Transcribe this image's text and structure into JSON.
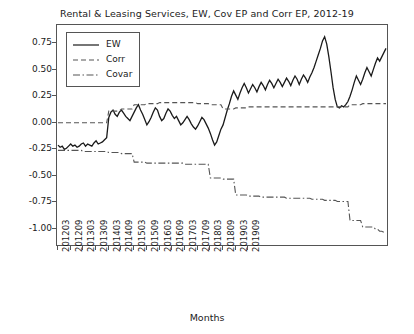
{
  "chart_data": {
    "type": "line",
    "title": "Rental & Leasing Services, EW, Cov EP and Corr EP, 2012-19",
    "xlabel": "Months",
    "ylabel": "",
    "ylim": [
      -1.15,
      0.92
    ],
    "yticks": [
      0.75,
      0.5,
      0.25,
      0.0,
      -0.25,
      -0.5,
      -0.75,
      -1.0
    ],
    "ytick_labels": [
      "0.75",
      "0.50",
      "0.25",
      "0.00",
      "-0.25",
      "-0.50",
      "-0.75",
      "-1.00"
    ],
    "xtick_labels": [
      "201203",
      "201209",
      "201303",
      "201309",
      "201403",
      "201409",
      "201503",
      "201509",
      "201603",
      "201609",
      "201703",
      "201709",
      "201803",
      "201809",
      "201903",
      "201909"
    ],
    "grid": false,
    "legend_position": "upper left",
    "series": [
      {
        "name": "EW",
        "style": "solid",
        "color": "#1a1a1a",
        "values": [
          -0.21,
          -0.23,
          -0.22,
          -0.25,
          -0.24,
          -0.22,
          -0.2,
          -0.22,
          -0.21,
          -0.23,
          -0.22,
          -0.2,
          -0.19,
          -0.22,
          -0.2,
          -0.21,
          -0.22,
          -0.19,
          -0.17,
          -0.2,
          -0.19,
          -0.18,
          -0.16,
          -0.14,
          0.05,
          0.1,
          0.12,
          0.08,
          0.06,
          0.1,
          0.12,
          0.09,
          0.06,
          0.04,
          0.02,
          0.06,
          0.1,
          0.14,
          0.17,
          0.12,
          0.08,
          0.03,
          -0.02,
          0.01,
          0.05,
          0.1,
          0.14,
          0.12,
          0.06,
          0.02,
          0.04,
          0.09,
          0.13,
          0.11,
          0.07,
          0.04,
          0.06,
          0.02,
          -0.02,
          0.0,
          0.03,
          0.06,
          0.03,
          -0.01,
          -0.04,
          -0.06,
          -0.03,
          0.01,
          0.05,
          0.03,
          -0.01,
          -0.05,
          -0.1,
          -0.16,
          -0.21,
          -0.18,
          -0.12,
          -0.06,
          -0.02,
          0.05,
          0.12,
          0.18,
          0.25,
          0.3,
          0.26,
          0.22,
          0.28,
          0.33,
          0.37,
          0.33,
          0.28,
          0.32,
          0.36,
          0.33,
          0.29,
          0.34,
          0.38,
          0.35,
          0.31,
          0.36,
          0.4,
          0.37,
          0.33,
          0.37,
          0.41,
          0.38,
          0.34,
          0.38,
          0.42,
          0.39,
          0.35,
          0.4,
          0.44,
          0.41,
          0.36,
          0.41,
          0.45,
          0.42,
          0.38,
          0.43,
          0.47,
          0.52,
          0.58,
          0.64,
          0.7,
          0.77,
          0.81,
          0.74,
          0.62,
          0.48,
          0.33,
          0.22,
          0.15,
          0.14,
          0.16,
          0.15,
          0.17,
          0.2,
          0.25,
          0.31,
          0.38,
          0.44,
          0.4,
          0.36,
          0.41,
          0.47,
          0.52,
          0.48,
          0.44,
          0.5,
          0.56,
          0.61,
          0.58,
          0.62,
          0.66,
          0.7
        ]
      },
      {
        "name": "Corr",
        "style": "dashed",
        "color": "#555555",
        "values": [
          0.0,
          0.0,
          0.0,
          0.0,
          0.0,
          0.0,
          0.0,
          0.0,
          0.0,
          0.0,
          0.0,
          0.0,
          0.0,
          0.0,
          0.0,
          0.0,
          0.0,
          0.0,
          0.0,
          0.0,
          0.0,
          0.0,
          0.0,
          0.0,
          0.11,
          0.11,
          0.11,
          0.11,
          0.11,
          0.11,
          0.13,
          0.13,
          0.13,
          0.13,
          0.13,
          0.13,
          0.17,
          0.17,
          0.17,
          0.17,
          0.17,
          0.17,
          0.18,
          0.18,
          0.18,
          0.18,
          0.18,
          0.18,
          0.19,
          0.19,
          0.19,
          0.19,
          0.19,
          0.19,
          0.19,
          0.19,
          0.19,
          0.19,
          0.19,
          0.19,
          0.19,
          0.19,
          0.19,
          0.19,
          0.19,
          0.19,
          0.18,
          0.18,
          0.18,
          0.18,
          0.18,
          0.18,
          0.17,
          0.17,
          0.17,
          0.17,
          0.17,
          0.17,
          0.13,
          0.13,
          0.13,
          0.13,
          0.13,
          0.13,
          0.14,
          0.14,
          0.14,
          0.14,
          0.14,
          0.14,
          0.15,
          0.15,
          0.15,
          0.15,
          0.15,
          0.15,
          0.15,
          0.15,
          0.15,
          0.15,
          0.15,
          0.15,
          0.15,
          0.15,
          0.15,
          0.15,
          0.15,
          0.15,
          0.15,
          0.15,
          0.15,
          0.15,
          0.15,
          0.15,
          0.15,
          0.15,
          0.15,
          0.15,
          0.15,
          0.15,
          0.15,
          0.15,
          0.15,
          0.15,
          0.15,
          0.15,
          0.15,
          0.15,
          0.15,
          0.15,
          0.15,
          0.15,
          0.15,
          0.15,
          0.15,
          0.15,
          0.15,
          0.15,
          0.17,
          0.17,
          0.17,
          0.17,
          0.17,
          0.17,
          0.18,
          0.18,
          0.18,
          0.18,
          0.18,
          0.18,
          0.18,
          0.18,
          0.18,
          0.18,
          0.18,
          0.18
        ]
      },
      {
        "name": "Covar",
        "style": "dashdot",
        "color": "#555555",
        "values": [
          -0.26,
          -0.26,
          -0.26,
          -0.26,
          -0.26,
          -0.26,
          -0.26,
          -0.26,
          -0.26,
          -0.26,
          -0.26,
          -0.26,
          -0.27,
          -0.27,
          -0.27,
          -0.27,
          -0.27,
          -0.27,
          -0.27,
          -0.27,
          -0.27,
          -0.27,
          -0.27,
          -0.27,
          -0.28,
          -0.28,
          -0.28,
          -0.28,
          -0.28,
          -0.28,
          -0.29,
          -0.29,
          -0.29,
          -0.29,
          -0.29,
          -0.29,
          -0.37,
          -0.37,
          -0.37,
          -0.37,
          -0.37,
          -0.37,
          -0.38,
          -0.38,
          -0.38,
          -0.38,
          -0.38,
          -0.38,
          -0.38,
          -0.38,
          -0.38,
          -0.38,
          -0.38,
          -0.38,
          -0.38,
          -0.38,
          -0.38,
          -0.38,
          -0.38,
          -0.38,
          -0.39,
          -0.39,
          -0.39,
          -0.39,
          -0.39,
          -0.39,
          -0.39,
          -0.39,
          -0.39,
          -0.39,
          -0.39,
          -0.39,
          -0.52,
          -0.52,
          -0.52,
          -0.52,
          -0.52,
          -0.52,
          -0.53,
          -0.53,
          -0.53,
          -0.53,
          -0.53,
          -0.53,
          -0.68,
          -0.68,
          -0.68,
          -0.68,
          -0.68,
          -0.68,
          -0.69,
          -0.69,
          -0.69,
          -0.69,
          -0.69,
          -0.69,
          -0.7,
          -0.7,
          -0.7,
          -0.7,
          -0.7,
          -0.7,
          -0.7,
          -0.7,
          -0.7,
          -0.7,
          -0.7,
          -0.7,
          -0.71,
          -0.71,
          -0.71,
          -0.71,
          -0.71,
          -0.71,
          -0.71,
          -0.71,
          -0.71,
          -0.71,
          -0.71,
          -0.71,
          -0.72,
          -0.72,
          -0.72,
          -0.72,
          -0.72,
          -0.72,
          -0.73,
          -0.73,
          -0.73,
          -0.73,
          -0.73,
          -0.73,
          -0.74,
          -0.74,
          -0.74,
          -0.74,
          -0.74,
          -0.74,
          -0.92,
          -0.92,
          -0.92,
          -0.92,
          -0.92,
          -0.92,
          -0.98,
          -0.98,
          -0.98,
          -0.98,
          -0.98,
          -0.98,
          -1.0,
          -1.0,
          -1.02,
          -1.02,
          -1.03,
          -1.04
        ]
      }
    ]
  }
}
